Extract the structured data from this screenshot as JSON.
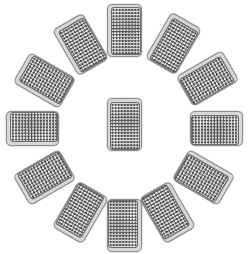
{
  "scene": {
    "title": "Clock card layout",
    "description": "Thirteen face-down playing cards arranged as a clock: twelve around a circle, one in the centre",
    "background_color": "#ffffff",
    "width": 250,
    "height": 254
  },
  "card_style": {
    "back_pattern": "diagonal-crosshatch",
    "border_color": "#8e8e8e",
    "margin_color": "#d8d8d8",
    "pattern_dark_color": "#585858",
    "pattern_light_color": "#f2f2f2",
    "corner_radius_px": 5,
    "width_px": 35,
    "height_px": 53
  },
  "cards": [
    {
      "id": "clock-12",
      "label": "12 o'clock",
      "position": "top",
      "x": 124.5,
      "y": 30.0,
      "rotation": 0,
      "face": "back"
    },
    {
      "id": "clock-1",
      "label": "1 o'clock",
      "position": "upper-right",
      "x": 173.0,
      "y": 43.5,
      "rotation": 30,
      "face": "back"
    },
    {
      "id": "clock-2",
      "label": "2 o'clock",
      "position": "right-upper",
      "x": 207.5,
      "y": 78.5,
      "rotation": 60,
      "face": "back"
    },
    {
      "id": "clock-3",
      "label": "3 o'clock",
      "position": "right",
      "x": 216.5,
      "y": 128.5,
      "rotation": 90,
      "face": "back"
    },
    {
      "id": "clock-4",
      "label": "4 o'clock",
      "position": "right-lower",
      "x": 203.5,
      "y": 177.0,
      "rotation": 120,
      "face": "back"
    },
    {
      "id": "clock-5",
      "label": "5 o'clock",
      "position": "lower-right",
      "x": 167.5,
      "y": 212.5,
      "rotation": 150,
      "face": "back"
    },
    {
      "id": "clock-6",
      "label": "6 o'clock",
      "position": "bottom",
      "x": 124.5,
      "y": 225.5,
      "rotation": 180,
      "face": "back"
    },
    {
      "id": "clock-7",
      "label": "7 o'clock",
      "position": "lower-left",
      "x": 80.0,
      "y": 212.5,
      "rotation": 210,
      "face": "back"
    },
    {
      "id": "clock-8",
      "label": "8 o'clock",
      "position": "left-lower",
      "x": 44.5,
      "y": 177.0,
      "rotation": 240,
      "face": "back"
    },
    {
      "id": "clock-9",
      "label": "9 o'clock",
      "position": "left",
      "x": 32.0,
      "y": 128.5,
      "rotation": 270,
      "face": "back"
    },
    {
      "id": "clock-10",
      "label": "10 o'clock",
      "position": "left-upper",
      "x": 44.5,
      "y": 80.0,
      "rotation": 300,
      "face": "back"
    },
    {
      "id": "clock-11",
      "label": "11 o'clock",
      "position": "upper-left",
      "x": 80.0,
      "y": 44.5,
      "rotation": 330,
      "face": "back"
    },
    {
      "id": "centre",
      "label": "centre",
      "position": "centre",
      "x": 124.0,
      "y": 124.5,
      "rotation": 0,
      "face": "back"
    }
  ]
}
